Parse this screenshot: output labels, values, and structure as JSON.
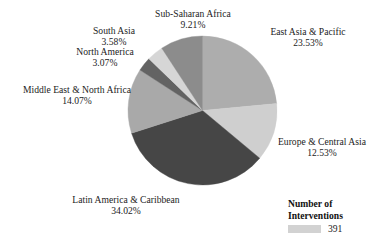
{
  "chart_data": {
    "type": "pie",
    "title": "",
    "subtitle": "",
    "xlabel": "",
    "ylabel": "",
    "grid": false,
    "legend_position": "bottom-right",
    "total_interventions": 391,
    "start_angle_deg": 0,
    "direction": "clockwise",
    "categories": [
      "East Asia & Pacific",
      "Europe & Central Asia",
      "Latin America & Caribbean",
      "Middle East & North Africa",
      "North America",
      "South Asia",
      "Sub-Saharan Africa"
    ],
    "values": [
      23.53,
      12.53,
      34.02,
      14.07,
      3.07,
      3.58,
      9.21
    ],
    "value_labels": [
      "23.53%",
      "12.53%",
      "34.02%",
      "14.07%",
      "3.07%",
      "3.58%",
      "9.21%"
    ],
    "colors": [
      "#ADADAD",
      "#CFCFCF",
      "#464646",
      "#A9A9A9",
      "#636363",
      "#D6D6D6",
      "#8C8C8C"
    ],
    "slices": [
      {
        "name": "East Asia & Pacific",
        "percent_label": "23.53%",
        "value": 23.53,
        "color": "#ADADAD"
      },
      {
        "name": "Europe & Central Asia",
        "percent_label": "12.53%",
        "value": 12.53,
        "color": "#CFCFCF"
      },
      {
        "name": "Latin America & Caribbean",
        "percent_label": "34.02%",
        "value": 34.02,
        "color": "#464646"
      },
      {
        "name": "Middle East & North Africa",
        "percent_label": "14.07%",
        "value": 14.07,
        "color": "#A9A9A9"
      },
      {
        "name": "North America",
        "percent_label": "3.07%",
        "value": 3.07,
        "color": "#636363"
      },
      {
        "name": "South Asia",
        "percent_label": "3.58%",
        "value": 3.58,
        "color": "#D6D6D6"
      },
      {
        "name": "Sub-Saharan Africa",
        "percent_label": "9.21%",
        "value": 9.21,
        "color": "#8C8C8C"
      }
    ]
  },
  "legend": {
    "title_line1": "Number of",
    "title_line2": "Interventions",
    "swatch_color": "#D2D2D2",
    "value": "391"
  }
}
